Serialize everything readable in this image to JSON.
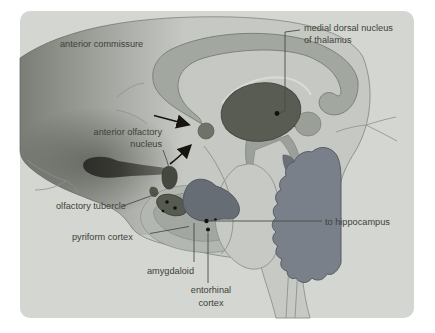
{
  "figure": {
    "type": "anatomical-diagram"
  },
  "labels": {
    "anterior_commissure": "anterior commissure",
    "medial_dorsal_line1": "medial dorsal nucleus",
    "medial_dorsal_line2": "of thalamus",
    "anterior_olfactory_line1": "anterior olfactory",
    "anterior_olfactory_line2": "nucleus",
    "olfactory_tubercle": "olfactory tubercle",
    "pyriform_cortex": "pyriform cortex",
    "amygdaloid": "amygdaloid",
    "entorhinal_line1": "entorhinal",
    "entorhinal_line2": "cortex",
    "to_hippocampus": "to hippocampus"
  },
  "colors": {
    "page": "#ffffff",
    "panel": "#d4d6d1",
    "hemisphere": "#c6c9c3",
    "corpus_callosum": "#a2a7a0",
    "thalamus": "#585c53",
    "midbrain": "#9ba09a",
    "colliculi_knob": "#9aa098",
    "pineal_dark": "#5d6156",
    "pons": "#c7cac4",
    "brainstem": "#c7cac4",
    "cerebellum": "#79808a",
    "tectum_dark": "#6b7077",
    "amygdala": "#676d74",
    "uncus_band": "#a2a7a1",
    "pyriform_band": "#b3b7b1",
    "anterior_olfactory_nucleus": "#45483f",
    "olfactory_tubercle_shape": "#565a4f",
    "commissure_dot": "#6e736a",
    "marker_black": "#16160f",
    "label_text": "#3e3f38"
  }
}
